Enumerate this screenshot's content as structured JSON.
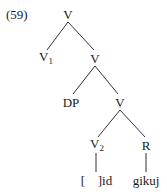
{
  "example": {
    "number": "(59)"
  },
  "tree": {
    "root": {
      "label": "V"
    },
    "v1": {
      "label": "V",
      "subscript": "1"
    },
    "v_mid": {
      "label": "V"
    },
    "dp": {
      "label": "DP"
    },
    "v_low": {
      "label": "V"
    },
    "v2": {
      "label": "V",
      "subscript": "2"
    },
    "r": {
      "label": "R"
    },
    "leaf_v2": {
      "open": "[",
      "close": "]id"
    },
    "leaf_r": {
      "label": "gikuj"
    }
  }
}
